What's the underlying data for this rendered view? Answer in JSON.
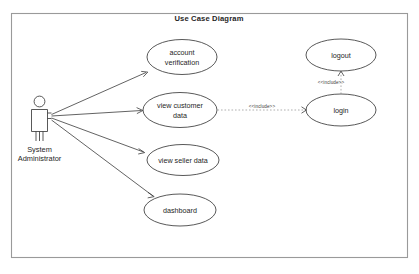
{
  "diagram": {
    "title": "Use Case Diagram",
    "actor": {
      "name": "System Administrator",
      "name_line1": "System",
      "name_line2": "Administrator",
      "icon": "actor-stick-figure"
    },
    "use_cases": [
      {
        "id": "account-verification",
        "label_line1": "account",
        "label_line2": "verification",
        "label": "account verification"
      },
      {
        "id": "view-customer-data",
        "label_line1": "view customer",
        "label_line2": "data",
        "label": "view customer data"
      },
      {
        "id": "view-seller-data",
        "label_line1": "view seller data",
        "label_line2": "",
        "label": "view seller data"
      },
      {
        "id": "dashboard",
        "label_line1": "dashboard",
        "label_line2": "",
        "label": "dashboard"
      },
      {
        "id": "logout",
        "label_line1": "logout",
        "label_line2": "",
        "label": "logout"
      },
      {
        "id": "login",
        "label_line1": "login",
        "label_line2": "",
        "label": "login"
      }
    ],
    "associations": [
      {
        "from": "System Administrator",
        "to": "account verification"
      },
      {
        "from": "System Administrator",
        "to": "view customer data"
      },
      {
        "from": "System Administrator",
        "to": "view seller data"
      },
      {
        "from": "System Administrator",
        "to": "dashboard"
      }
    ],
    "include_relations": [
      {
        "from": "view customer data",
        "to": "login",
        "stereotype": "<<include>>",
        "orientation": "horizontal"
      },
      {
        "from": "login",
        "to": "logout",
        "stereotype": "<<include>>",
        "orientation": "vertical"
      }
    ],
    "colors": {
      "background": "#ffffff",
      "frame_stroke": "#9a9a9a",
      "shape_stroke": "#3b3b3b",
      "text": "#262626",
      "include_stroke": "#8d8d8d"
    }
  }
}
